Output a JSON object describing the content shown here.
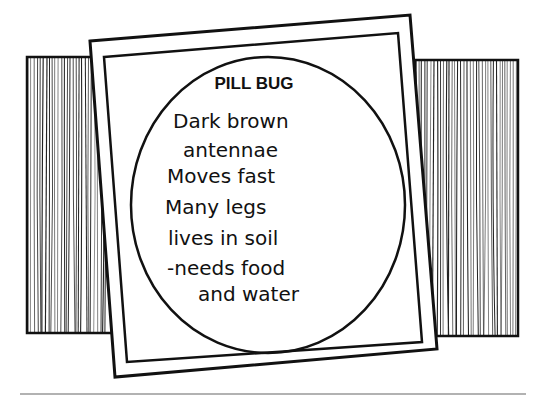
{
  "card": {
    "title": "PILL BUG",
    "notes": [
      "Dark brown",
      "antennae",
      "Moves fast",
      "Many legs",
      "lives in soil",
      "-needs food",
      "and water"
    ]
  },
  "colors": {
    "ink": "#111111",
    "paper": "#ffffff",
    "rule": "#999999"
  }
}
